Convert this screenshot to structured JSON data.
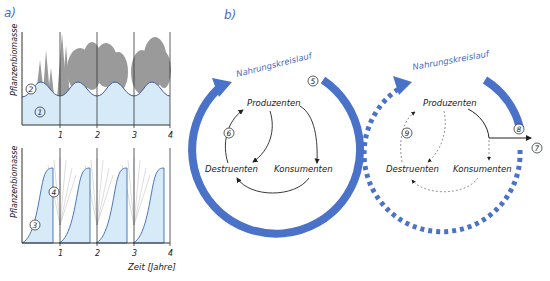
{
  "panels": {
    "a": {
      "label": "a)",
      "top_chart": {
        "ylabel": "Pflanzenbiomasse",
        "ticks": [
          "1",
          "2",
          "3",
          "4"
        ],
        "markers": {
          "m1": "1",
          "m2": "2"
        }
      },
      "bottom_chart": {
        "ylabel": "Pflanzenbiomasse",
        "ticks": [
          "1",
          "2",
          "3",
          "4"
        ],
        "xlabel": "Zeit [Jahre]",
        "markers": {
          "m3": "3",
          "m4": "4"
        }
      }
    },
    "b": {
      "label": "b)",
      "left_cycle": {
        "title": "Nahrungskreislauf",
        "producers": "Produzenten",
        "consumers": "Konsumenten",
        "decomposers": "Destruenten",
        "markers": {
          "m5": "5",
          "m6": "6"
        }
      },
      "right_cycle": {
        "title": "Nahrungskreislauf",
        "producers": "Produzenten",
        "consumers": "Konsumenten",
        "decomposers": "Destruenten",
        "markers": {
          "m7": "7",
          "m8": "8",
          "m9": "9"
        }
      }
    }
  },
  "colors": {
    "accent_blue": "#4a72c8",
    "fill_light_blue": "#d6ebf7",
    "tree_gray": "#9a9a9a",
    "line_dark": "#222222"
  }
}
